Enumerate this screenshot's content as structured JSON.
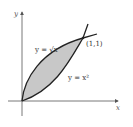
{
  "diagram": {
    "title": "",
    "axes": {
      "x_label": "x",
      "y_label": "y"
    },
    "curves": [
      {
        "name": "sqrt-curve",
        "label": "y = √x"
      },
      {
        "name": "square-curve",
        "label": "y = x²"
      }
    ],
    "points": [
      {
        "label": "(1,1)",
        "x": 1,
        "y": 1
      }
    ],
    "shaded_region": "area between y = √x and y = x² from x=0 to x=1",
    "colors": {
      "shade": "#c8c8c8",
      "curve": "#222222",
      "axis": "#555555"
    }
  }
}
